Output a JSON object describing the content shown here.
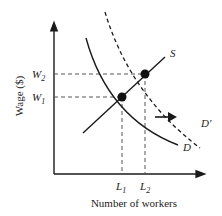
{
  "diagram": {
    "y_axis_label": "Wage ($)",
    "x_axis_label": "Number of workers",
    "wage_levels": [
      {
        "main": "W",
        "sub": "2"
      },
      {
        "main": "W",
        "sub": "1"
      }
    ],
    "labor_levels": [
      {
        "main": "L",
        "sub": "1"
      },
      {
        "main": "L",
        "sub": "2"
      }
    ],
    "curves": {
      "supply": "S",
      "demand": "D",
      "new_demand": "D′"
    },
    "shift_arrow": "right-arrow-icon",
    "colors": {
      "line": "#1a1a1a",
      "dashed_guide": "#555555",
      "background": "#ffffff"
    }
  }
}
